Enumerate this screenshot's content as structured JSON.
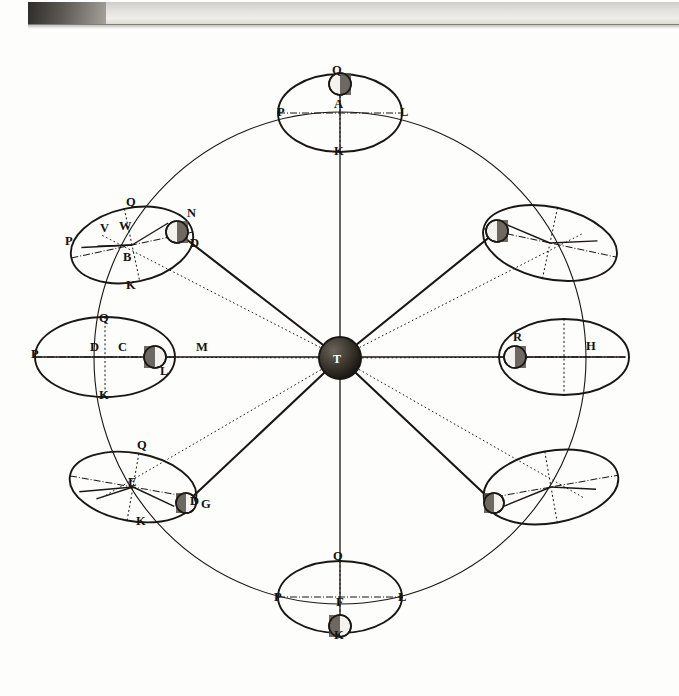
{
  "figure": {
    "kind": "astronomical-diagram",
    "center_body_label": "T",
    "ink_color": "#1a1713",
    "paper_color": "#fdfdfc",
    "page_edge_color": "#cfcdc9"
  },
  "chart_data": {
    "type": "scatter",
    "title": "",
    "xlabel": "",
    "ylabel": "",
    "center": {
      "label": "T",
      "x": 340,
      "y": 358,
      "r": 21
    },
    "outer_circle": {
      "cx": 340,
      "cy": 358,
      "r": 246
    },
    "epicycles": [
      {
        "id": "top",
        "cx": 340,
        "cy": 113,
        "rx": 62,
        "ry": 39,
        "tilt": 0,
        "center_label": "A",
        "labels": [
          {
            "text": "Q",
            "x": 332,
            "y": 74
          },
          {
            "text": "P",
            "x": 277,
            "y": 116
          },
          {
            "text": "A",
            "x": 334,
            "y": 108
          },
          {
            "text": "L",
            "x": 400,
            "y": 116
          },
          {
            "text": "K",
            "x": 334,
            "y": 155
          }
        ],
        "moon": {
          "x": 340,
          "y": 84,
          "r": 11,
          "lit": "right"
        }
      },
      {
        "id": "upper-left",
        "cx": 132,
        "cy": 245,
        "rx": 62,
        "ry": 37,
        "tilt": -12,
        "center_label": "B",
        "labels": [
          {
            "text": "Q",
            "x": 126,
            "y": 206
          },
          {
            "text": "V",
            "x": 100,
            "y": 232
          },
          {
            "text": "W",
            "x": 119,
            "y": 230
          },
          {
            "text": "P",
            "x": 65,
            "y": 245
          },
          {
            "text": "B",
            "x": 123,
            "y": 261
          },
          {
            "text": "K",
            "x": 126,
            "y": 289
          },
          {
            "text": "N",
            "x": 187,
            "y": 217
          },
          {
            "text": "D",
            "x": 190,
            "y": 247
          }
        ],
        "moon": {
          "x": 177,
          "y": 232,
          "r": 11,
          "lit": "right"
        }
      },
      {
        "id": "left",
        "cx": 105,
        "cy": 357,
        "rx": 70,
        "ry": 40,
        "tilt": 0,
        "center_label": "C",
        "labels": [
          {
            "text": "Q",
            "x": 99,
            "y": 322
          },
          {
            "text": "P",
            "x": 31,
            "y": 358
          },
          {
            "text": "D",
            "x": 90,
            "y": 351
          },
          {
            "text": "C",
            "x": 118,
            "y": 351
          },
          {
            "text": "K",
            "x": 99,
            "y": 399
          },
          {
            "text": "L",
            "x": 160,
            "y": 375
          },
          {
            "text": "M",
            "x": 196,
            "y": 351
          }
        ],
        "moon": {
          "x": 155,
          "y": 357,
          "r": 11,
          "lit": "left"
        }
      },
      {
        "id": "lower-left",
        "cx": 133,
        "cy": 487,
        "rx": 64,
        "ry": 34,
        "tilt": 10,
        "center_label": "E",
        "labels": [
          {
            "text": "Q",
            "x": 137,
            "y": 449
          },
          {
            "text": "E",
            "x": 128,
            "y": 486
          },
          {
            "text": "K",
            "x": 136,
            "y": 525
          },
          {
            "text": "D",
            "x": 190,
            "y": 505
          },
          {
            "text": "G",
            "x": 201,
            "y": 508
          }
        ],
        "moon": {
          "x": 186,
          "y": 503,
          "r": 10,
          "lit": "left"
        }
      },
      {
        "id": "bottom",
        "cx": 340,
        "cy": 597,
        "rx": 62,
        "ry": 36,
        "tilt": 0,
        "center_label": "F",
        "labels": [
          {
            "text": "Q",
            "x": 333,
            "y": 560
          },
          {
            "text": "P",
            "x": 274,
            "y": 601
          },
          {
            "text": "F",
            "x": 336,
            "y": 606
          },
          {
            "text": "L",
            "x": 398,
            "y": 601
          },
          {
            "text": "K",
            "x": 334,
            "y": 639
          }
        ],
        "moon": {
          "x": 340,
          "y": 626,
          "r": 11,
          "lit": "left"
        }
      },
      {
        "id": "lower-right",
        "cx": 551,
        "cy": 487,
        "rx": 68,
        "ry": 36,
        "tilt": -10,
        "center_label": "",
        "labels": [],
        "moon": {
          "x": 494,
          "y": 503,
          "r": 10,
          "lit": "left"
        }
      },
      {
        "id": "right",
        "cx": 564,
        "cy": 357,
        "rx": 65,
        "ry": 38,
        "tilt": 0,
        "center_label": "H",
        "labels": [
          {
            "text": "R",
            "x": 513,
            "y": 341
          },
          {
            "text": "H",
            "x": 586,
            "y": 350
          }
        ],
        "moon": {
          "x": 515,
          "y": 357,
          "r": 11,
          "lit": "right"
        }
      },
      {
        "id": "upper-right",
        "cx": 550,
        "cy": 243,
        "rx": 68,
        "ry": 36,
        "tilt": 12,
        "center_label": "",
        "labels": [],
        "moon": {
          "x": 497,
          "y": 231,
          "r": 11,
          "lit": "right"
        }
      }
    ],
    "rays_from_center": [
      {
        "to_id": "upper-left",
        "x2": 177,
        "y2": 232
      },
      {
        "to_id": "left",
        "x2": 155,
        "y2": 357
      },
      {
        "to_id": "lower-left",
        "x2": 186,
        "y2": 503
      },
      {
        "to_id": "bottom",
        "x2": 340,
        "y2": 626
      },
      {
        "to_id": "lower-right",
        "x2": 494,
        "y2": 503
      },
      {
        "to_id": "right",
        "x2": 515,
        "y2": 357
      },
      {
        "to_id": "upper-right",
        "x2": 497,
        "y2": 231
      },
      {
        "to_id": "top",
        "x2": 340,
        "y2": 84
      }
    ],
    "axes": [
      {
        "name": "vertical-axis",
        "x1": 340,
        "y1": 84,
        "x2": 340,
        "y2": 626
      },
      {
        "name": "horizontal-axis",
        "x1": 35,
        "y1": 357,
        "x2": 625,
        "y2": 357
      }
    ]
  }
}
